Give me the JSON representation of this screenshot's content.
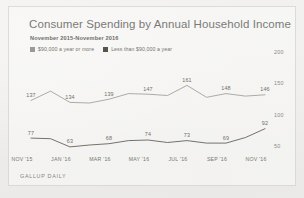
{
  "title": "Consumer Spending by Annual Household Income",
  "subtitle": "November 2015-November 2016",
  "footer": "GALLUP DAILY",
  "legend": [
    {
      "label": "$90,000 a year or more",
      "color": "#9a9a96",
      "swatch_icon": "legend-swatch"
    },
    {
      "label": "Less than $90,000 a year",
      "color": "#55554f",
      "swatch_icon": "legend-swatch"
    }
  ],
  "yticks": [
    "200",
    "150",
    "100",
    "50"
  ],
  "xticks": [
    "NOV '15",
    "JAN '16",
    "MAR '16",
    "MAY '16",
    "JUL '16",
    "SEP '16",
    "NOV '16"
  ],
  "chart_data": {
    "type": "line",
    "title": "Consumer Spending by Annual Household Income",
    "subtitle": "November 2015-November 2016",
    "xlabel": "",
    "ylabel": "",
    "ylim": [
      50,
      200
    ],
    "yticks": [
      200,
      150,
      100,
      50
    ],
    "grid": false,
    "legend_position": "top-left",
    "source": "GALLUP DAILY",
    "categories": [
      "NOV '15",
      "DEC '15",
      "JAN '16",
      "FEB '16",
      "MAR '16",
      "APR '16",
      "MAY '16",
      "JUN '16",
      "JUL '16",
      "AUG '16",
      "SEP '16",
      "OCT '16",
      "NOV '16"
    ],
    "series": [
      {
        "name": "$90,000 a year or more",
        "color": "#9a9a96",
        "values": [
          137,
          152,
          134,
          133,
          139,
          148,
          147,
          145,
          161,
          142,
          148,
          144,
          146
        ],
        "labeled_points": [
          {
            "category": "NOV '15",
            "value": 137
          },
          {
            "category": "JAN '16",
            "value": 134
          },
          {
            "category": "MAR '16",
            "value": 139
          },
          {
            "category": "MAY '16",
            "value": 147
          },
          {
            "category": "JUL '16",
            "value": 161
          },
          {
            "category": "SEP '16",
            "value": 148
          },
          {
            "category": "NOV '16",
            "value": 146
          }
        ]
      },
      {
        "name": "Less than $90,000 a year",
        "color": "#55554f",
        "values": [
          77,
          76,
          63,
          66,
          68,
          73,
          74,
          70,
          73,
          69,
          69,
          78,
          92
        ],
        "labeled_points": [
          {
            "category": "NOV '15",
            "value": 77
          },
          {
            "category": "JAN '16",
            "value": 63
          },
          {
            "category": "MAR '16",
            "value": 68
          },
          {
            "category": "MAY '16",
            "value": 74
          },
          {
            "category": "JUL '16",
            "value": 73
          },
          {
            "category": "SEP '16",
            "value": 69
          },
          {
            "category": "NOV '16",
            "value": 92
          }
        ]
      }
    ]
  }
}
